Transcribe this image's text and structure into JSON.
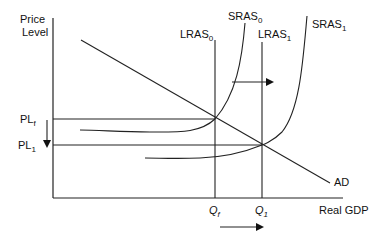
{
  "diagram": {
    "title": "",
    "axes": {
      "y_label_line1": "Price",
      "y_label_line2": "Level",
      "x_label": "Real GDP"
    },
    "price_levels": {
      "upper": {
        "main": "PL",
        "sub": "f"
      },
      "lower": {
        "main": "PL",
        "sub": "1"
      }
    },
    "quantities": {
      "left": {
        "main": "Q",
        "sub": "f"
      },
      "right": {
        "main": "Q",
        "sub": "1"
      }
    },
    "curves": {
      "lras0": {
        "main": "LRAS",
        "sub": "0"
      },
      "lras1": {
        "main": "LRAS",
        "sub": "1"
      },
      "sras0": {
        "main": "SRAS",
        "sub": "0"
      },
      "sras1": {
        "main": "SRAS",
        "sub": "1"
      },
      "ad": {
        "main": "AD"
      }
    },
    "arrows": [
      {
        "name": "sras-shift-right",
        "direction": "right"
      },
      {
        "name": "output-shift-right",
        "direction": "right"
      },
      {
        "name": "price-level-fall",
        "direction": "down"
      }
    ],
    "colors": {
      "line": "#222222",
      "text": "#111111",
      "background": "#ffffff"
    }
  }
}
